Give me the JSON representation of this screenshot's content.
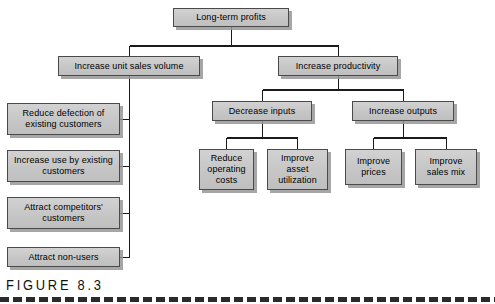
{
  "figure": {
    "caption": "FIGURE  8.3",
    "colors": {
      "box_fill": "#c9c9c9",
      "box_border": "#4a4a4a",
      "connector": "#1a1a1a",
      "shadow": "#969696",
      "background": "#ffffff",
      "caption_text": "#111111"
    }
  },
  "diagram": {
    "type": "hierarchical-tree",
    "root": "Long-term profits",
    "nodes": [
      {
        "id": "long-term-profits",
        "label": "Long-term profits",
        "level": 0,
        "x": 173,
        "y": 8,
        "w": 116,
        "h": 19
      },
      {
        "id": "increase-unit-sales-volume",
        "label": "Increase unit sales volume",
        "level": 1,
        "x": 58,
        "y": 56,
        "w": 142,
        "h": 20
      },
      {
        "id": "increase-productivity",
        "label": "Increase productivity",
        "level": 1,
        "x": 278,
        "y": 56,
        "w": 120,
        "h": 20
      },
      {
        "id": "reduce-defection-of-existing-customers",
        "label": "Reduce defection of existing customers",
        "level": 2,
        "x": 7,
        "y": 103,
        "w": 113,
        "h": 32
      },
      {
        "id": "increase-use-by-existing-customers",
        "label": "Increase use by existing customers",
        "level": 2,
        "x": 7,
        "y": 150,
        "w": 113,
        "h": 32
      },
      {
        "id": "attract-competitors-customers",
        "label": "Attract competitors' customers",
        "level": 2,
        "x": 7,
        "y": 197,
        "w": 113,
        "h": 32
      },
      {
        "id": "attract-non-users",
        "label": "Attract non-users",
        "level": 2,
        "x": 7,
        "y": 247,
        "w": 113,
        "h": 20
      },
      {
        "id": "decrease-inputs",
        "label": "Decrease inputs",
        "level": 2,
        "x": 212,
        "y": 101,
        "w": 100,
        "h": 20
      },
      {
        "id": "increase-outputs",
        "label": "Increase outputs",
        "level": 2,
        "x": 352,
        "y": 101,
        "w": 102,
        "h": 20
      },
      {
        "id": "reduce-operating-costs",
        "label": "Reduce operating costs",
        "level": 3,
        "x": 199,
        "y": 149,
        "w": 55,
        "h": 41
      },
      {
        "id": "improve-asset-utilization",
        "label": "Improve asset utilization",
        "level": 3,
        "x": 267,
        "y": 149,
        "w": 61,
        "h": 41
      },
      {
        "id": "improve-prices",
        "label": "Improve prices",
        "level": 3,
        "x": 345,
        "y": 149,
        "w": 57,
        "h": 36
      },
      {
        "id": "improve-sales-mix",
        "label": "Improve sales mix",
        "level": 3,
        "x": 415,
        "y": 149,
        "w": 62,
        "h": 36
      }
    ],
    "edges": [
      {
        "from": "long-term-profits",
        "to": "increase-unit-sales-volume"
      },
      {
        "from": "long-term-profits",
        "to": "increase-productivity"
      },
      {
        "from": "increase-unit-sales-volume",
        "to": "reduce-defection-of-existing-customers"
      },
      {
        "from": "increase-unit-sales-volume",
        "to": "increase-use-by-existing-customers"
      },
      {
        "from": "increase-unit-sales-volume",
        "to": "attract-competitors-customers"
      },
      {
        "from": "increase-unit-sales-volume",
        "to": "attract-non-users"
      },
      {
        "from": "increase-productivity",
        "to": "decrease-inputs"
      },
      {
        "from": "increase-productivity",
        "to": "increase-outputs"
      },
      {
        "from": "decrease-inputs",
        "to": "reduce-operating-costs"
      },
      {
        "from": "decrease-inputs",
        "to": "improve-asset-utilization"
      },
      {
        "from": "increase-outputs",
        "to": "improve-prices"
      },
      {
        "from": "increase-outputs",
        "to": "improve-sales-mix"
      }
    ]
  }
}
